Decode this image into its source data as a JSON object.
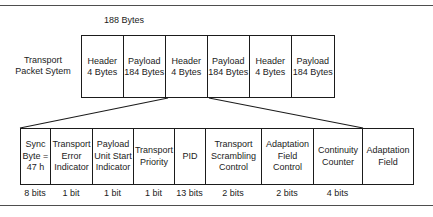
{
  "figure": {
    "dimension_label": "188 Bytes",
    "packet_caption_lines": [
      "Transport",
      "Packet Sytem"
    ]
  },
  "packet_row": {
    "cells": [
      {
        "name": "header",
        "title": "Header",
        "size": "4 Bytes",
        "width": 41.6
      },
      {
        "name": "payload",
        "title": "Payload",
        "size": "184 Bytes",
        "width": 42.4
      },
      {
        "name": "header",
        "title": "Header",
        "size": "4 Bytes",
        "width": 41.6
      },
      {
        "name": "payload",
        "title": "Payload",
        "size": "184 Bytes",
        "width": 42.4
      },
      {
        "name": "header",
        "title": "Header",
        "size": "4 Bytes",
        "width": 41.6
      },
      {
        "name": "payload",
        "title": "Payload",
        "size": "184 Bytes",
        "width": 42.4
      }
    ]
  },
  "header_fields": {
    "fields": [
      {
        "label": "Sync\nByte =\n47 h",
        "bits": "8 bits",
        "width": 30
      },
      {
        "label": "Transport\nError\nIndicator",
        "bits": "1 bit",
        "width": 42
      },
      {
        "label": "Payload\nUnit Start\nIndicator",
        "bits": "1 bit",
        "width": 41
      },
      {
        "label": "Transport\nPriority",
        "bits": "1 bit",
        "width": 41
      },
      {
        "label": "PID",
        "bits": "13 bits",
        "width": 31
      },
      {
        "label": "Transport\nScrambling\nControl",
        "bits": "2 bits",
        "width": 56
      },
      {
        "label": "Adaptation\nField\nControl",
        "bits": "2 bits",
        "width": 52
      },
      {
        "label": "Continuity\nCounter",
        "bits": "4 bits",
        "width": 49
      },
      {
        "label": "Adaptation\nField",
        "bits": "",
        "width": 50
      }
    ]
  },
  "colors": {
    "line": "#1b1b1b",
    "rule": "#4e4e4e",
    "background": "#ffffff"
  }
}
